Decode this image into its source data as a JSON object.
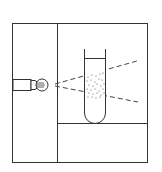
{
  "diagram": {
    "title": "",
    "components": [
      {
        "id": "frame",
        "label": ""
      },
      {
        "id": "light-bulb",
        "label": ""
      },
      {
        "id": "light-beam",
        "label": ""
      },
      {
        "id": "test-tube",
        "label": ""
      },
      {
        "id": "particles",
        "label": ""
      }
    ],
    "colors": {
      "line": "#333333",
      "background": "#ffffff",
      "dots": "#555555"
    }
  }
}
